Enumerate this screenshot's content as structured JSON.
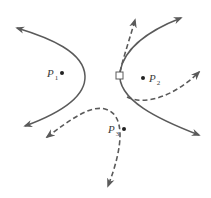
{
  "diagram": {
    "colors": {
      "stroke": "#5a5a5a",
      "text": "#3a3a3a",
      "background": "#ffffff"
    },
    "points": [
      {
        "id": "P1",
        "label": "P",
        "subscript": "1"
      },
      {
        "id": "P2",
        "label": "P",
        "subscript": "2"
      },
      {
        "id": "P3",
        "label": "P",
        "subscript": "3"
      }
    ],
    "curves": [
      {
        "id": "left-parabola",
        "style": "solid",
        "arrows": "both-ends",
        "focus": "P1"
      },
      {
        "id": "right-parabola",
        "style": "solid",
        "arrows": "both-ends",
        "focus": "P2"
      },
      {
        "id": "dashed-upward-branch",
        "style": "dashed",
        "arrows": "end",
        "origin": "square-marker"
      },
      {
        "id": "dashed-right-branch",
        "style": "dashed",
        "arrows": "end",
        "focus": "P2"
      },
      {
        "id": "dashed-p3-curve",
        "style": "dashed",
        "arrows": "both-ends",
        "focus": "P3"
      }
    ],
    "marker": {
      "shape": "square",
      "location": "vertex of right parabola"
    }
  }
}
